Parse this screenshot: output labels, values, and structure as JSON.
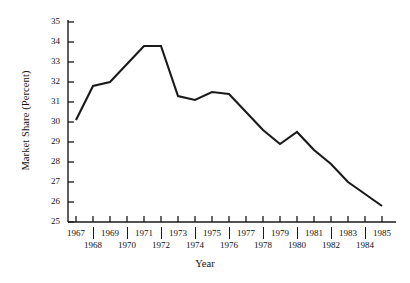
{
  "chart_data": {
    "type": "line",
    "title": "",
    "xlabel": "Year",
    "ylabel": "Market Share (Percent)",
    "x": [
      1967,
      1968,
      1969,
      1970,
      1971,
      1972,
      1973,
      1974,
      1975,
      1976,
      1977,
      1978,
      1979,
      1980,
      1981,
      1982,
      1983,
      1984,
      1985
    ],
    "values": [
      30.1,
      31.8,
      32.0,
      32.9,
      33.8,
      33.8,
      31.3,
      31.1,
      31.5,
      31.4,
      30.5,
      29.6,
      28.9,
      29.5,
      28.6,
      27.9,
      27.0,
      26.4,
      25.8
    ],
    "series": [
      {
        "name": "Market Share",
        "values": [
          30.1,
          31.8,
          32.0,
          32.9,
          33.8,
          33.8,
          31.3,
          31.1,
          31.5,
          31.4,
          30.5,
          29.6,
          28.9,
          29.5,
          28.6,
          27.9,
          27.0,
          26.4,
          25.8
        ]
      }
    ],
    "ylim": [
      25,
      35
    ],
    "xlim": [
      1967,
      1985
    ],
    "yticks": [
      25,
      26,
      27,
      28,
      29,
      30,
      31,
      32,
      33,
      34,
      35
    ],
    "ytick_labels": [
      "25",
      "26",
      "27",
      "28",
      "29",
      "30",
      "31",
      "32",
      "33",
      "34",
      "35"
    ],
    "xticks": [
      1967,
      1968,
      1969,
      1970,
      1971,
      1972,
      1973,
      1974,
      1975,
      1976,
      1977,
      1978,
      1979,
      1980,
      1981,
      1982,
      1983,
      1984,
      1985
    ],
    "xtick_labels_top": [
      "1967",
      "1969",
      "1971",
      "1973",
      "1975",
      "1977",
      "1979",
      "1981",
      "1983",
      "1985"
    ],
    "xtick_labels_bottom": [
      "1968",
      "1970",
      "1972",
      "1974",
      "1976",
      "1978",
      "1980",
      "1982",
      "1984"
    ],
    "grid": false,
    "legend": "none",
    "line_color": "#1a1a1a",
    "axis_color": "#1a1a1a"
  }
}
